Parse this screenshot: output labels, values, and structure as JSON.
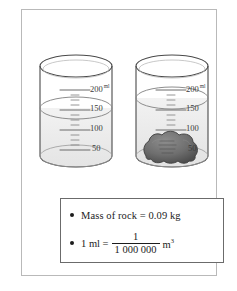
{
  "figure": {
    "border_color": "#b9b9b9",
    "ink_color": "#1c1c1c"
  },
  "beakers": [
    {
      "id": "beaker-left",
      "name": "beaker-without-rock",
      "scale_labels": [
        "200",
        "150",
        "100",
        "50"
      ],
      "unit_label": "ml",
      "water_level_label": "150",
      "water_level_value": 150,
      "has_rock": false
    },
    {
      "id": "beaker-right",
      "name": "beaker-with-rock",
      "scale_labels": [
        "200",
        "150",
        "100",
        "50"
      ],
      "unit_label": "ml",
      "water_level_label": "150",
      "water_level_value": 180,
      "has_rock": true,
      "rock_color": "#6e6e6e"
    }
  ],
  "facts": {
    "rock_mass": {
      "text": "Mass of rock = 0.09 kg",
      "label": "Mass of rock",
      "equals": "=",
      "value": "0.09",
      "unit": "kg"
    },
    "volume_conversion": {
      "lead": "1 ml =",
      "numerator": "1",
      "denominator": "1 000 000",
      "unit_base": "m",
      "unit_exponent": "3"
    }
  }
}
